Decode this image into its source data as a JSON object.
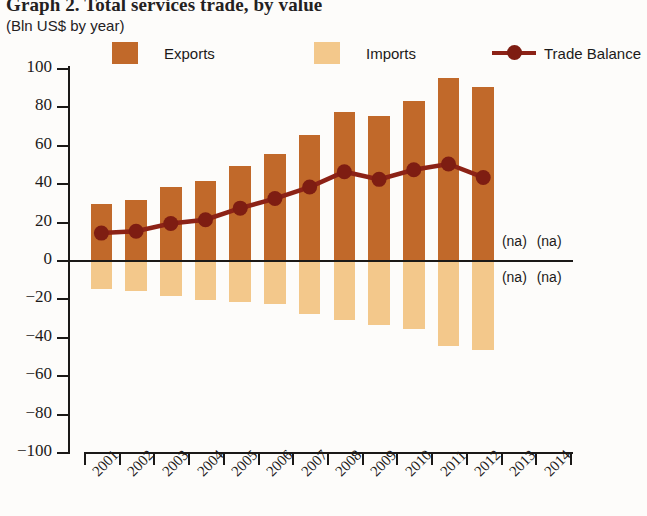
{
  "title": "Graph 2. Total services trade, by value",
  "subtitle": "(Bln US$ by year)",
  "legend": {
    "exports": "Exports",
    "imports": "Imports",
    "balance": "Trade Balance"
  },
  "colors": {
    "exports": "#c1692a",
    "imports": "#f3c88b",
    "balance": "#8c2216",
    "axis": "#1b1917",
    "background": "#fdfcfa"
  },
  "na_label": "(na)",
  "na_markers": [
    {
      "year": "2013",
      "position": "above"
    },
    {
      "year": "2014",
      "position": "above"
    },
    {
      "year": "2013",
      "position": "below"
    },
    {
      "year": "2014",
      "position": "below"
    }
  ],
  "chart_data": {
    "type": "bar",
    "title": "Graph 2. Total services trade, by value",
    "subtitle": "(Bln US$ by year)",
    "xlabel": "",
    "ylabel": "Bln US$",
    "ylim": [
      -100,
      100
    ],
    "ytick_step": 20,
    "yticks": [
      100,
      80,
      60,
      40,
      20,
      0,
      -20,
      -40,
      -60,
      -80,
      -100
    ],
    "ytick_labels": [
      "100",
      "80",
      "60",
      "40",
      "20",
      "0",
      "−20",
      "−40",
      "−60",
      "−80",
      "−100"
    ],
    "categories": [
      "2001",
      "2002",
      "2003",
      "2004",
      "2005",
      "2006",
      "2007",
      "2008",
      "2009",
      "2010",
      "2011",
      "2012",
      "2013",
      "2014"
    ],
    "grid": false,
    "legend_position": "top",
    "series": [
      {
        "name": "Exports",
        "type": "bar",
        "color": "#c1692a",
        "values": [
          29,
          31,
          38,
          41,
          49,
          55,
          65,
          77,
          75,
          83,
          95,
          90,
          null,
          null
        ]
      },
      {
        "name": "Imports",
        "type": "bar",
        "color": "#f3c88b",
        "values": [
          -15,
          -16,
          -19,
          -21,
          -22,
          -23,
          -28,
          -31,
          -34,
          -36,
          -45,
          -47,
          null,
          null
        ]
      },
      {
        "name": "Trade Balance",
        "type": "line",
        "color": "#8c2216",
        "values": [
          14,
          15,
          19,
          21,
          27,
          32,
          38,
          46,
          42,
          47,
          50,
          43,
          null,
          null
        ]
      }
    ]
  }
}
